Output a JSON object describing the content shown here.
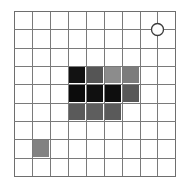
{
  "grid": {
    "rows": 9,
    "cols": 9,
    "x_lines": [
      14,
      32,
      50,
      68,
      86,
      104,
      122,
      140,
      157,
      175
    ],
    "y_lines": [
      11,
      29,
      48,
      66,
      84,
      103,
      121,
      139,
      158,
      176
    ],
    "line_color": "#7a7a7a",
    "border_color": "#6e6e6e",
    "background": "#ffffff"
  },
  "shaded_cells": [
    {
      "row": 3,
      "col": 3,
      "color": "#121212"
    },
    {
      "row": 3,
      "col": 4,
      "color": "#555555"
    },
    {
      "row": 3,
      "col": 5,
      "color": "#8c8c8c"
    },
    {
      "row": 3,
      "col": 6,
      "color": "#7c7c7c"
    },
    {
      "row": 4,
      "col": 3,
      "color": "#0c0c0c"
    },
    {
      "row": 4,
      "col": 4,
      "color": "#101010"
    },
    {
      "row": 4,
      "col": 5,
      "color": "#0e0e0e"
    },
    {
      "row": 4,
      "col": 6,
      "color": "#585858"
    },
    {
      "row": 5,
      "col": 3,
      "color": "#5a5a5a"
    },
    {
      "row": 5,
      "col": 4,
      "color": "#5e5e5e"
    },
    {
      "row": 5,
      "col": 5,
      "color": "#5a5a5a"
    },
    {
      "row": 7,
      "col": 1,
      "color": "#828282"
    }
  ],
  "marker": {
    "type": "open-circle",
    "x_line_index": 8,
    "y_line_index": 1,
    "radius": 6,
    "fill": "#ffffff",
    "stroke": "#3a3a3a"
  }
}
